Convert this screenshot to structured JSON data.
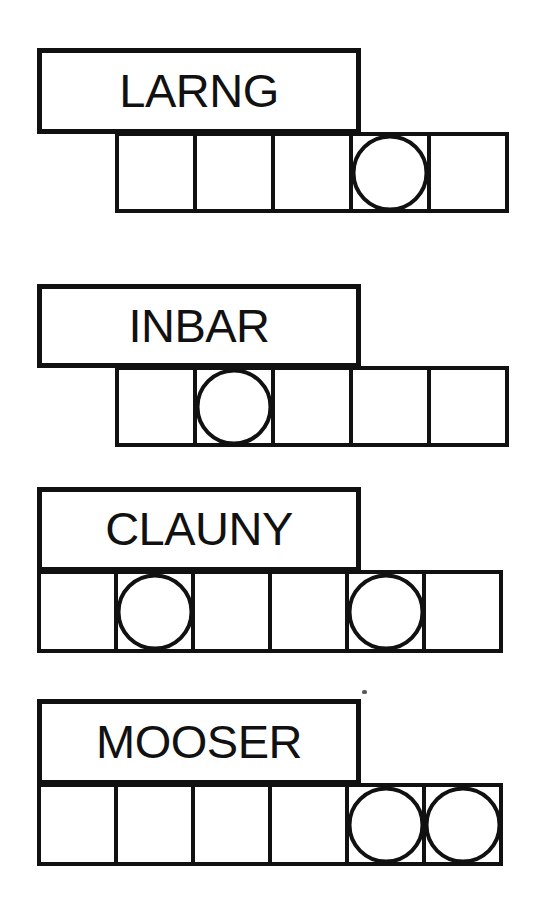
{
  "page": {
    "background_color": "#ffffff",
    "ink_color": "#111111",
    "width": 555,
    "height": 903
  },
  "rows": [
    {
      "id": "row-larng",
      "word": "LARNG",
      "label_box": {
        "x": 37,
        "y": 48,
        "w": 324,
        "h": 86
      },
      "cell_row": {
        "x": 115,
        "y": 132,
        "cell_w": 82,
        "cell_h": 81
      },
      "cell_count": 5,
      "cells": [
        {
          "index": 1,
          "circle": false
        },
        {
          "index": 2,
          "circle": false
        },
        {
          "index": 3,
          "circle": false
        },
        {
          "index": 4,
          "circle": true
        },
        {
          "index": 5,
          "circle": false
        }
      ]
    },
    {
      "id": "row-inbar",
      "word": "INBAR",
      "label_box": {
        "x": 37,
        "y": 284,
        "w": 324,
        "h": 84
      },
      "cell_row": {
        "x": 115,
        "y": 366,
        "cell_w": 82,
        "cell_h": 81
      },
      "cell_count": 5,
      "cells": [
        {
          "index": 1,
          "circle": false
        },
        {
          "index": 2,
          "circle": true
        },
        {
          "index": 3,
          "circle": false
        },
        {
          "index": 4,
          "circle": false
        },
        {
          "index": 5,
          "circle": false
        }
      ]
    },
    {
      "id": "row-clauny",
      "word": "CLAUNY",
      "label_box": {
        "x": 37,
        "y": 487,
        "w": 324,
        "h": 85
      },
      "cell_row": {
        "x": 37,
        "y": 570,
        "cell_w": 81,
        "cell_h": 83
      },
      "cell_count": 6,
      "cells": [
        {
          "index": 1,
          "circle": false
        },
        {
          "index": 2,
          "circle": true
        },
        {
          "index": 3,
          "circle": false
        },
        {
          "index": 4,
          "circle": false
        },
        {
          "index": 5,
          "circle": true
        },
        {
          "index": 6,
          "circle": false
        }
      ]
    },
    {
      "id": "row-mooser",
      "word": "MOOSER",
      "label_box": {
        "x": 37,
        "y": 699,
        "w": 324,
        "h": 86
      },
      "cell_row": {
        "x": 37,
        "y": 783,
        "cell_w": 81,
        "cell_h": 83
      },
      "cell_count": 6,
      "cells": [
        {
          "index": 1,
          "circle": false
        },
        {
          "index": 2,
          "circle": false
        },
        {
          "index": 3,
          "circle": false
        },
        {
          "index": 4,
          "circle": false
        },
        {
          "index": 5,
          "circle": true
        },
        {
          "index": 6,
          "circle": true
        }
      ]
    }
  ],
  "marks": [
    {
      "id": "print-speck",
      "x": 362,
      "y": 690,
      "w": 5,
      "h": 4
    }
  ]
}
